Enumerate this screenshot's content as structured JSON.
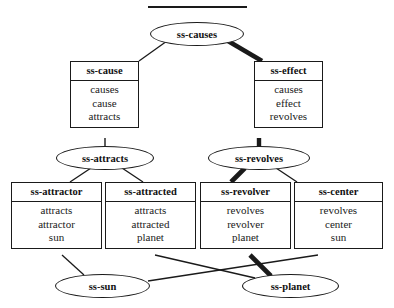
{
  "diagram": {
    "title_rule": "",
    "type": "semantic-network-inheritance-hierarchy",
    "nodes": {
      "ss_causes": {
        "label": "ss-causes",
        "shape": "ellipse",
        "x": 150,
        "y": 22,
        "w": 94,
        "h": 24
      },
      "ss_cause": {
        "label": "ss-cause",
        "shape": "box",
        "x": 70,
        "y": 61,
        "w": 69,
        "h": 77,
        "slots": [
          "causes",
          "cause",
          "attracts"
        ]
      },
      "ss_effect": {
        "label": "ss-effect",
        "shape": "box",
        "x": 254,
        "y": 61,
        "w": 69,
        "h": 77,
        "slots": [
          "causes",
          "effect",
          "revolves"
        ]
      },
      "ss_attracts": {
        "label": "ss-attracts",
        "shape": "ellipse",
        "x": 56,
        "y": 146,
        "w": 98,
        "h": 24
      },
      "ss_revolves": {
        "label": "ss-revolves",
        "shape": "ellipse",
        "x": 208,
        "y": 146,
        "w": 102,
        "h": 24
      },
      "ss_attractor": {
        "label": "ss-attractor",
        "shape": "box",
        "x": 11,
        "y": 182,
        "w": 91,
        "h": 73,
        "slots": [
          "attracts",
          "attractor",
          "sun"
        ]
      },
      "ss_attracted": {
        "label": "ss-attracted",
        "shape": "box",
        "x": 105,
        "y": 182,
        "w": 91,
        "h": 73,
        "slots": [
          "attracts",
          "attracted",
          "planet"
        ]
      },
      "ss_revolver": {
        "label": "ss-revolver",
        "shape": "box",
        "x": 200,
        "y": 182,
        "w": 91,
        "h": 73,
        "slots": [
          "revolves",
          "revolver",
          "planet"
        ]
      },
      "ss_center": {
        "label": "ss-center",
        "shape": "box",
        "x": 294,
        "y": 182,
        "w": 89,
        "h": 73,
        "slots": [
          "revolves",
          "center",
          "sun"
        ]
      },
      "ss_sun": {
        "label": "ss-sun",
        "shape": "ellipse",
        "x": 55,
        "y": 274,
        "w": 95,
        "h": 24
      },
      "ss_planet": {
        "label": "ss-planet",
        "shape": "ellipse",
        "x": 242,
        "y": 274,
        "w": 97,
        "h": 24
      }
    },
    "edges": [
      {
        "from": "ss_causes",
        "to": "ss_cause",
        "weight": "thin"
      },
      {
        "from": "ss_causes",
        "to": "ss_effect",
        "weight": "bold"
      },
      {
        "from": "ss_cause",
        "to": "ss_attracts",
        "weight": "thin"
      },
      {
        "from": "ss_effect",
        "to": "ss_revolves",
        "weight": "bold"
      },
      {
        "from": "ss_attracts",
        "to": "ss_attractor",
        "weight": "thin"
      },
      {
        "from": "ss_attracts",
        "to": "ss_attracted",
        "weight": "thin"
      },
      {
        "from": "ss_revolves",
        "to": "ss_revolver",
        "weight": "bold"
      },
      {
        "from": "ss_revolves",
        "to": "ss_center",
        "weight": "thin"
      },
      {
        "from": "ss_attractor",
        "to": "ss_sun",
        "weight": "thin"
      },
      {
        "from": "ss_attracted",
        "to": "ss_planet",
        "weight": "thin"
      },
      {
        "from": "ss_revolver",
        "to": "ss_planet",
        "weight": "bold"
      },
      {
        "from": "ss_center",
        "to": "ss_sun",
        "weight": "thin"
      }
    ],
    "colors": {
      "ink": "#1a1a1a",
      "background": "#ffffff"
    }
  }
}
